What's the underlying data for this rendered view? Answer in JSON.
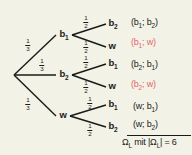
{
  "diagram": {
    "background_color": "#f2f2e6",
    "line_color": "#1a1a1a",
    "highlight_color": "#e4656a",
    "root": {
      "label": ""
    },
    "level1": [
      {
        "id": "n-b1",
        "label": "b",
        "sub": "1",
        "probability_num": "1",
        "probability_den": "3"
      },
      {
        "id": "n-b2",
        "label": "b",
        "sub": "2",
        "probability_num": "1",
        "probability_den": "3"
      },
      {
        "id": "n-w",
        "label": "w",
        "sub": "",
        "probability_num": "1",
        "probability_den": "3"
      }
    ],
    "level2": [
      {
        "id": "l-b1b2",
        "label": "b",
        "sub": "2",
        "probability_num": "1",
        "probability_den": "2"
      },
      {
        "id": "l-b1w",
        "label": "w",
        "sub": "",
        "probability_num": "1",
        "probability_den": "2"
      },
      {
        "id": "l-b2b1",
        "label": "b",
        "sub": "1",
        "probability_num": "1",
        "probability_den": "2"
      },
      {
        "id": "l-b2w",
        "label": "w",
        "sub": "",
        "probability_num": "1",
        "probability_den": "2"
      },
      {
        "id": "l-wb1",
        "label": "b",
        "sub": "1",
        "probability_num": "1",
        "probability_den": "2"
      },
      {
        "id": "l-wb2",
        "label": "b",
        "sub": "2",
        "probability_num": "1",
        "probability_den": "2"
      }
    ],
    "outcomes": [
      {
        "id": "o-1",
        "open": "(b",
        "sub1": "1",
        "sep": "; b",
        "sub2": "2",
        "close": ")",
        "highlighted": false
      },
      {
        "id": "o-2",
        "open": "(b",
        "sub1": "1",
        "sep": "; w",
        "sub2": "",
        "close": ")",
        "highlighted": true
      },
      {
        "id": "o-3",
        "open": "(b",
        "sub1": "2",
        "sep": "; b",
        "sub2": "1",
        "close": ")",
        "highlighted": false
      },
      {
        "id": "o-4",
        "open": "(b",
        "sub1": "2",
        "sep": "; w",
        "sub2": "",
        "close": ")",
        "highlighted": true
      },
      {
        "id": "o-5",
        "open": "(w",
        "sub1": "",
        "sep": "; b",
        "sub2": "1",
        "close": ")",
        "highlighted": false
      },
      {
        "id": "o-6",
        "open": "(w",
        "sub1": "",
        "sep": "; b",
        "sub2": "2",
        "close": ")",
        "highlighted": false
      }
    ],
    "summary": {
      "omega": "Ω",
      "omega_sub": "L",
      "mit": " mit |",
      "omega2": "Ω",
      "omega2_sub": "L",
      "equals": "| = 6"
    }
  }
}
